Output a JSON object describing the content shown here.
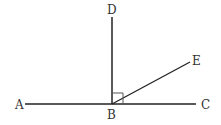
{
  "diagram": {
    "points": {
      "A": {
        "label": "A",
        "x": 20,
        "y": 104
      },
      "B": {
        "label": "B",
        "x": 112,
        "y": 104
      },
      "C": {
        "label": "C",
        "x": 206,
        "y": 104
      },
      "D": {
        "label": "D",
        "x": 112,
        "y": 10
      },
      "E": {
        "label": "E",
        "x": 196,
        "y": 61
      }
    },
    "segments": [
      "AC",
      "BD",
      "BE"
    ],
    "right_angle": {
      "at": "B",
      "between": [
        "BD",
        "BC"
      ]
    },
    "line_color": "#222222"
  }
}
